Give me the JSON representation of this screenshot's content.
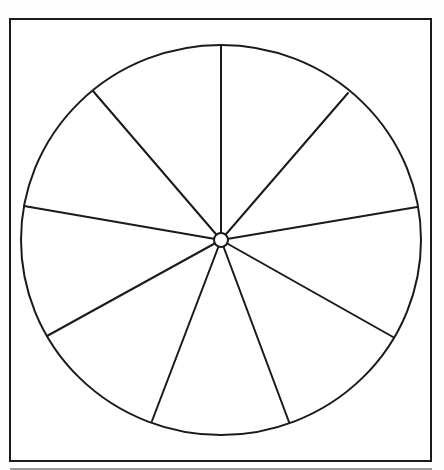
{
  "diagram": {
    "type": "segmented-wheel",
    "stroke_color": "#1a1a1a",
    "background_color": "#ffffff",
    "page_color": "#fdfdfd",
    "bottom_rule_color": "#9a9a9a",
    "frame": {
      "x": 10,
      "y": 19,
      "width": 421,
      "height": 442,
      "stroke_width": 2
    },
    "bottom_rule": {
      "x1": 10,
      "y1": 469,
      "x2": 432,
      "y2": 469,
      "stroke_width": 2
    },
    "wheel": {
      "cx": 221,
      "cy": 240,
      "rx": 200,
      "ry": 195,
      "stroke_width": 2
    },
    "hub": {
      "cx": 221,
      "cy": 240,
      "r": 7,
      "stroke_width": 2
    },
    "segment_count": 9,
    "segment_labels": [],
    "spokes": [
      {
        "name": "spoke-top",
        "x": 221,
        "y": 46
      },
      {
        "name": "spoke-upper-right",
        "x": 348,
        "y": 93
      },
      {
        "name": "spoke-right",
        "x": 417,
        "y": 207
      },
      {
        "name": "spoke-lower-right",
        "x": 393,
        "y": 337
      },
      {
        "name": "spoke-bottom-right",
        "x": 289,
        "y": 422
      },
      {
        "name": "spoke-bottom-left",
        "x": 152,
        "y": 421
      },
      {
        "name": "spoke-lower-left",
        "x": 47,
        "y": 336
      },
      {
        "name": "spoke-left",
        "x": 24,
        "y": 206
      },
      {
        "name": "spoke-upper-left",
        "x": 93,
        "y": 91
      }
    ]
  }
}
